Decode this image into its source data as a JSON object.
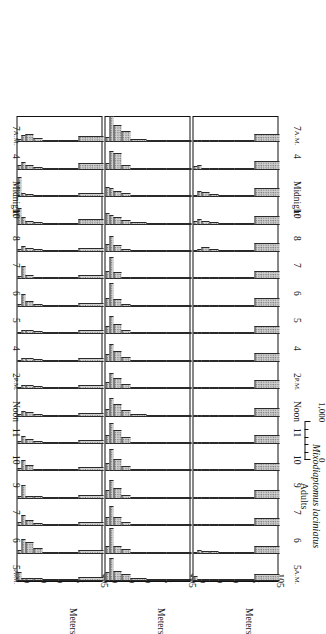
{
  "figure": {
    "axis_title": "Meters",
    "depth_ticks_labeled": [
      "0",
      "10",
      "30",
      "50",
      "75",
      "105"
    ],
    "depth_tick_values": [
      0,
      5,
      10,
      20,
      30,
      50,
      75
    ],
    "depth_axis_max": 105,
    "scale_bar": {
      "zero_label": "0",
      "max_label": "1,000",
      "max_value": 1000
    },
    "times": [
      "5 A.M.",
      "6",
      "7",
      "9",
      "10",
      "11",
      "Noon",
      "2 P.M.",
      "4",
      "5",
      "6",
      "7",
      "8",
      "10",
      "Midnight",
      "4",
      "7 A.M."
    ]
  },
  "chart_data": {
    "type": "bar",
    "xlabel": "Meters",
    "ylabel": "Time of day",
    "xlim": [
      0,
      105
    ],
    "ylim": [
      0,
      1000
    ],
    "grid": false,
    "legend": "none",
    "depth_bin_edges": [
      0,
      5,
      10,
      20,
      30,
      50,
      75,
      105
    ],
    "times": [
      "5 A.M.",
      "6",
      "7",
      "9",
      "10",
      "11",
      "Noon",
      "2 P.M.",
      "4",
      "5",
      "6",
      "7",
      "8",
      "10",
      "Midnight",
      "4",
      "7 A.M."
    ],
    "panels": [
      {
        "name": "Eudiaptomus gracilis Adults",
        "species": "Eudiaptomus gracilis",
        "stage": "Adults",
        "profiles": [
          {
            "time": "5 A.M.",
            "values": [
              330,
              120,
              110,
              100,
              40,
              30,
              150
            ]
          },
          {
            "time": "6",
            "values": [
              150,
              560,
              430,
              200,
              60,
              30,
              120
            ]
          },
          {
            "time": "7",
            "values": [
              140,
              430,
              230,
              110,
              50,
              30,
              150
            ]
          },
          {
            "time": "9",
            "values": [
              120,
              500,
              120,
              90,
              50,
              30,
              140
            ]
          },
          {
            "time": "10",
            "values": [
              110,
              420,
              240,
              100,
              40,
              30,
              150
            ]
          },
          {
            "time": "11",
            "values": [
              100,
              300,
              180,
              110,
              40,
              30,
              140
            ]
          },
          {
            "time": "Noon",
            "values": [
              90,
              210,
              170,
              110,
              40,
              30,
              150
            ]
          },
          {
            "time": "2 P.M.",
            "values": [
              80,
              170,
              150,
              110,
              40,
              30,
              150
            ]
          },
          {
            "time": "4",
            "values": [
              80,
              150,
              130,
              100,
              40,
              30,
              140
            ]
          },
          {
            "time": "5",
            "values": [
              90,
              160,
              150,
              110,
              40,
              30,
              150
            ]
          },
          {
            "time": "6",
            "values": [
              120,
              480,
              210,
              100,
              40,
              30,
              140
            ]
          },
          {
            "time": "7",
            "values": [
              130,
              520,
              180,
              90,
              40,
              30,
              150
            ]
          },
          {
            "time": "8",
            "values": [
              110,
              230,
              150,
              100,
              40,
              30,
              150
            ]
          },
          {
            "time": "10",
            "values": [
              640,
              300,
              140,
              90,
              40,
              30,
              200
            ]
          },
          {
            "time": "Midnight",
            "values": [
              780,
              160,
              110,
              80,
              40,
              30,
              150
            ]
          },
          {
            "time": "4",
            "values": [
              200,
              300,
              200,
              100,
              40,
              30,
              240
            ]
          },
          {
            "time": "7 A.M.",
            "values": [
              120,
              280,
              330,
              180,
              70,
              40,
              260
            ]
          }
        ]
      },
      {
        "name": "Eudiaptomus gracilis Young",
        "species": "Eudiaptomus gracilis",
        "stage": "Young",
        "profiles": [
          {
            "time": "5 A.M.",
            "values": [
              330,
              880,
              380,
              250,
              110,
              40,
              20
            ]
          },
          {
            "time": "6",
            "values": [
              300,
              960,
              300,
              160,
              70,
              30,
              20
            ]
          },
          {
            "time": "7",
            "values": [
              350,
              760,
              330,
              140,
              60,
              30,
              20
            ]
          },
          {
            "time": "9",
            "values": [
              320,
              700,
              420,
              150,
              60,
              30,
              20
            ]
          },
          {
            "time": "10",
            "values": [
              330,
              830,
              460,
              200,
              60,
              30,
              20
            ]
          },
          {
            "time": "11",
            "values": [
              340,
              800,
              520,
              260,
              90,
              40,
              20
            ]
          },
          {
            "time": "Noon",
            "values": [
              300,
              700,
              470,
              230,
              80,
              40,
              20
            ]
          },
          {
            "time": "2 P.M.",
            "values": [
              280,
              620,
              430,
              200,
              70,
              30,
              20
            ]
          },
          {
            "time": "4",
            "values": [
              300,
              660,
              420,
              180,
              70,
              30,
              20
            ]
          },
          {
            "time": "5",
            "values": [
              310,
              700,
              400,
              170,
              60,
              30,
              20
            ]
          },
          {
            "time": "6",
            "values": [
              340,
              900,
              300,
              120,
              50,
              30,
              20
            ]
          },
          {
            "time": "7",
            "values": [
              330,
              840,
              280,
              110,
              50,
              30,
              20
            ]
          },
          {
            "time": "8",
            "values": [
              300,
              620,
              250,
              110,
              50,
              30,
              20
            ]
          },
          {
            "time": "10",
            "values": [
              420,
              380,
              290,
              160,
              90,
              50,
              30
            ]
          },
          {
            "time": "Midnight",
            "values": [
              400,
              330,
              250,
              150,
              70,
              40,
              20
            ]
          },
          {
            "time": "4",
            "values": [
              250,
              700,
              640,
              180,
              60,
              30,
              20
            ]
          },
          {
            "time": "7 A.M.",
            "values": [
              200,
              980,
              640,
              420,
              120,
              40,
              20
            ]
          }
        ]
      },
      {
        "name": "Mixodiaptomus laciniatus Adults",
        "species": "Mixodiaptomus laciniatus",
        "stage": "Adults",
        "profiles": [
          {
            "time": "5 A.M.",
            "values": [
              170,
              30,
              20,
              20,
              20,
              30,
              260
            ]
          },
          {
            "time": "6",
            "values": [
              30,
              120,
              110,
              100,
              70,
              40,
              300
            ]
          },
          {
            "time": "7",
            "values": [
              30,
              60,
              80,
              80,
              60,
              40,
              320
            ]
          },
          {
            "time": "9",
            "values": [
              30,
              40,
              30,
              30,
              30,
              40,
              330
            ]
          },
          {
            "time": "10",
            "values": [
              30,
              40,
              30,
              30,
              30,
              40,
              320
            ]
          },
          {
            "time": "11",
            "values": [
              30,
              40,
              30,
              30,
              30,
              40,
              330
            ]
          },
          {
            "time": "Noon",
            "values": [
              30,
              40,
              30,
              30,
              30,
              40,
              320
            ]
          },
          {
            "time": "2 P.M.",
            "values": [
              30,
              40,
              30,
              30,
              30,
              40,
              330
            ]
          },
          {
            "time": "4",
            "values": [
              30,
              40,
              30,
              30,
              30,
              40,
              320
            ]
          },
          {
            "time": "5",
            "values": [
              30,
              40,
              30,
              30,
              30,
              40,
              330
            ]
          },
          {
            "time": "6",
            "values": [
              30,
              40,
              40,
              30,
              30,
              40,
              340
            ]
          },
          {
            "time": "7",
            "values": [
              30,
              50,
              40,
              40,
              30,
              40,
              330
            ]
          },
          {
            "time": "8",
            "values": [
              40,
              120,
              200,
              110,
              50,
              40,
              330
            ]
          },
          {
            "time": "10",
            "values": [
              130,
              200,
              150,
              110,
              50,
              40,
              340
            ]
          },
          {
            "time": "Midnight",
            "values": [
              80,
              230,
              190,
              120,
              50,
              40,
              330
            ]
          },
          {
            "time": "4",
            "values": [
              140,
              170,
              60,
              40,
              30,
              40,
              330
            ]
          },
          {
            "time": "7 A.M.",
            "values": [
              20,
              20,
              20,
              20,
              20,
              30,
              300
            ]
          }
        ]
      }
    ]
  }
}
